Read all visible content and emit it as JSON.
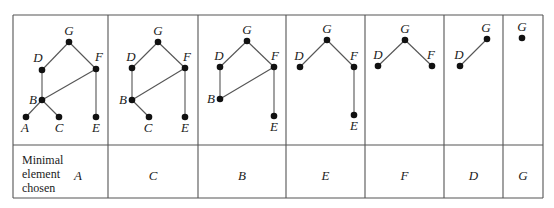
{
  "figure": {
    "row_header": [
      "Minimal",
      "element",
      "chosen"
    ],
    "colors": {
      "line": "#555555",
      "node": "#111111",
      "text": "#1a1a1a"
    },
    "steps": [
      {
        "chosen": "A",
        "nodes": [
          {
            "id": "G",
            "x": 69,
            "y": 42,
            "lx": 69,
            "ly": 35,
            "anchor": "middle"
          },
          {
            "id": "D",
            "x": 42,
            "y": 70,
            "lx": 38,
            "ly": 62,
            "anchor": "middle"
          },
          {
            "id": "F",
            "x": 96,
            "y": 69,
            "lx": 99,
            "ly": 61,
            "anchor": "middle"
          },
          {
            "id": "B",
            "x": 42,
            "y": 100,
            "lx": 33,
            "ly": 104,
            "anchor": "middle"
          },
          {
            "id": "A",
            "x": 26,
            "y": 117,
            "lx": 25,
            "ly": 132,
            "anchor": "middle"
          },
          {
            "id": "C",
            "x": 59,
            "y": 117,
            "lx": 59,
            "ly": 132,
            "anchor": "middle"
          },
          {
            "id": "E",
            "x": 96,
            "y": 117,
            "lx": 96,
            "ly": 132,
            "anchor": "middle"
          }
        ],
        "edges": [
          [
            "G",
            "D"
          ],
          [
            "G",
            "F"
          ],
          [
            "D",
            "B"
          ],
          [
            "F",
            "B"
          ],
          [
            "F",
            "E"
          ],
          [
            "B",
            "A"
          ],
          [
            "B",
            "C"
          ]
        ]
      },
      {
        "chosen": "C",
        "nodes": [
          {
            "id": "G",
            "x": 158,
            "y": 42,
            "lx": 158,
            "ly": 35,
            "anchor": "middle"
          },
          {
            "id": "D",
            "x": 132,
            "y": 68,
            "lx": 131,
            "ly": 61,
            "anchor": "middle"
          },
          {
            "id": "F",
            "x": 185,
            "y": 68,
            "lx": 187,
            "ly": 61,
            "anchor": "middle"
          },
          {
            "id": "B",
            "x": 132,
            "y": 100,
            "lx": 123,
            "ly": 104,
            "anchor": "middle"
          },
          {
            "id": "C",
            "x": 149,
            "y": 117,
            "lx": 148,
            "ly": 132,
            "anchor": "middle"
          },
          {
            "id": "E",
            "x": 185,
            "y": 117,
            "lx": 185,
            "ly": 132,
            "anchor": "middle"
          }
        ],
        "edges": [
          [
            "G",
            "D"
          ],
          [
            "G",
            "F"
          ],
          [
            "D",
            "B"
          ],
          [
            "F",
            "B"
          ],
          [
            "F",
            "E"
          ],
          [
            "B",
            "C"
          ]
        ]
      },
      {
        "chosen": "B",
        "nodes": [
          {
            "id": "G",
            "x": 247,
            "y": 41,
            "lx": 247,
            "ly": 34,
            "anchor": "middle"
          },
          {
            "id": "D",
            "x": 220,
            "y": 67,
            "lx": 219,
            "ly": 60,
            "anchor": "middle"
          },
          {
            "id": "F",
            "x": 274,
            "y": 67,
            "lx": 275,
            "ly": 60,
            "anchor": "middle"
          },
          {
            "id": "B",
            "x": 220,
            "y": 99,
            "lx": 211,
            "ly": 103,
            "anchor": "middle"
          },
          {
            "id": "E",
            "x": 274,
            "y": 116,
            "lx": 274,
            "ly": 131,
            "anchor": "middle"
          }
        ],
        "edges": [
          [
            "G",
            "D"
          ],
          [
            "G",
            "F"
          ],
          [
            "D",
            "B"
          ],
          [
            "F",
            "B"
          ],
          [
            "F",
            "E"
          ]
        ]
      },
      {
        "chosen": "E",
        "nodes": [
          {
            "id": "G",
            "x": 327,
            "y": 40,
            "lx": 327,
            "ly": 33,
            "anchor": "middle"
          },
          {
            "id": "D",
            "x": 300,
            "y": 67,
            "lx": 299,
            "ly": 60,
            "anchor": "middle"
          },
          {
            "id": "F",
            "x": 354,
            "y": 67,
            "lx": 354,
            "ly": 60,
            "anchor": "middle"
          },
          {
            "id": "E",
            "x": 354,
            "y": 115,
            "lx": 354,
            "ly": 130,
            "anchor": "middle"
          }
        ],
        "edges": [
          [
            "G",
            "D"
          ],
          [
            "G",
            "F"
          ],
          [
            "F",
            "E"
          ]
        ]
      },
      {
        "chosen": "F",
        "nodes": [
          {
            "id": "G",
            "x": 405,
            "y": 40,
            "lx": 405,
            "ly": 33,
            "anchor": "middle"
          },
          {
            "id": "D",
            "x": 378,
            "y": 66,
            "lx": 378,
            "ly": 59,
            "anchor": "middle"
          },
          {
            "id": "F",
            "x": 432,
            "y": 66,
            "lx": 431,
            "ly": 59,
            "anchor": "middle"
          }
        ],
        "edges": [
          [
            "G",
            "D"
          ],
          [
            "G",
            "F"
          ]
        ]
      },
      {
        "chosen": "D",
        "nodes": [
          {
            "id": "G",
            "x": 487,
            "y": 39,
            "lx": 486,
            "ly": 32,
            "anchor": "middle"
          },
          {
            "id": "D",
            "x": 460,
            "y": 66,
            "lx": 459,
            "ly": 59,
            "anchor": "middle"
          }
        ],
        "edges": [
          [
            "G",
            "D"
          ]
        ]
      },
      {
        "chosen": "G",
        "nodes": [
          {
            "id": "G",
            "x": 522,
            "y": 38,
            "lx": 522,
            "ly": 31,
            "anchor": "middle"
          }
        ],
        "edges": []
      }
    ]
  },
  "layout": {
    "columns": [
      13,
      108,
      198,
      286,
      365,
      444,
      503,
      543
    ],
    "top": 15,
    "row_split": 145,
    "bottom": 198
  }
}
